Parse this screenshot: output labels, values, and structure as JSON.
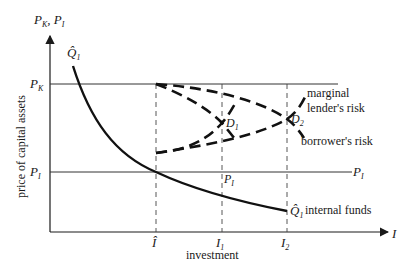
{
  "diagram": {
    "y_axis_label": "P",
    "y_axis_label_sub1": "K",
    "y_axis_label_sep": ", P",
    "y_axis_label_sub2": "I",
    "y_axis_title": "price of capital assets",
    "x_axis_label": "I",
    "x_axis_title": "investment",
    "price_levels": {
      "pk": {
        "symbol": "P",
        "sub": "K"
      },
      "pi": {
        "symbol": "P",
        "sub": "I"
      }
    },
    "x_ticks": [
      {
        "symbol": "Î",
        "sub": ""
      },
      {
        "symbol": "I",
        "sub": "1"
      },
      {
        "symbol": "I",
        "sub": "2"
      }
    ],
    "curves": {
      "internal_funds": {
        "symbol": "Q̂",
        "sub": "1",
        "label": "internal funds"
      },
      "lenders_risk": {
        "label_line1": "marginal",
        "label_line2": "lender's risk"
      },
      "borrowers_risk": {
        "label": "borrower's risk"
      }
    },
    "points": {
      "d1": {
        "symbol": "D",
        "sub": "1"
      },
      "d2": {
        "symbol": "D",
        "sub": "2"
      }
    },
    "pi_mid_label": {
      "symbol": "P",
      "sub": "I"
    },
    "pi_right_label": {
      "symbol": "P",
      "sub": "I"
    }
  }
}
